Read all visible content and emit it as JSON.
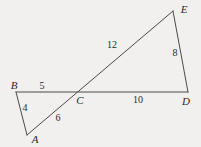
{
  "figure": {
    "background_color": "#f2f0ee",
    "stroke_color": "#4a4a4a",
    "text_color": "#2a2a2a",
    "vertices": [
      {
        "name": "A",
        "label": "A",
        "x": 27,
        "y": 135,
        "label_x": 35,
        "label_y": 139
      },
      {
        "name": "B",
        "label": "B",
        "x": 16,
        "y": 92,
        "label_x": 14,
        "label_y": 85
      },
      {
        "name": "C",
        "label": "C",
        "x": 77,
        "y": 91,
        "label_x": 80,
        "label_y": 100
      },
      {
        "name": "D",
        "label": "D",
        "x": 188,
        "y": 92,
        "label_x": 186,
        "label_y": 101
      },
      {
        "name": "E",
        "label": "E",
        "x": 173,
        "y": 11,
        "label_x": 184,
        "label_y": 9
      }
    ],
    "segments": [
      {
        "name": "segment-B-D",
        "from": "B",
        "to": "D"
      },
      {
        "name": "segment-A-E",
        "from": "A",
        "to": "E"
      },
      {
        "name": "segment-B-A",
        "from": "B",
        "to": "A"
      },
      {
        "name": "segment-E-D",
        "from": "E",
        "to": "D"
      }
    ],
    "length_labels": [
      {
        "name": "length-BC",
        "value": "5",
        "x": 42,
        "y": 86
      },
      {
        "name": "length-AB",
        "value": "4",
        "x": 25,
        "y": 108
      },
      {
        "name": "length-AC",
        "value": "6",
        "x": 58,
        "y": 118
      },
      {
        "name": "length-CE",
        "value": "12",
        "x": 112,
        "y": 45
      },
      {
        "name": "length-DE",
        "value": "8",
        "x": 175,
        "y": 53
      },
      {
        "name": "length-CD",
        "value": "10",
        "x": 138,
        "y": 100
      }
    ]
  }
}
